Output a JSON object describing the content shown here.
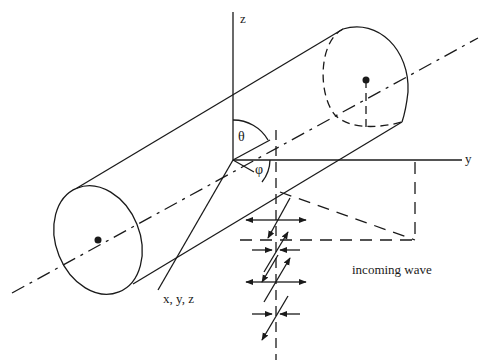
{
  "figure": {
    "type": "geometry-diagram",
    "colors": {
      "ink": "#1a1a1a",
      "background": "#ffffff"
    }
  },
  "axes": {
    "z_label": "z",
    "y_label": "y",
    "x_label": "x, y, z"
  },
  "angles": {
    "theta_label": "θ",
    "phi_label": "φ"
  },
  "wave": {
    "label": "incoming wave"
  }
}
